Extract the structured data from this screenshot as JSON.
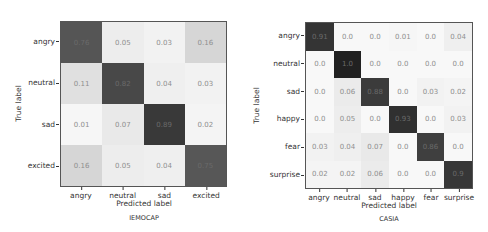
{
  "chart_data": [
    {
      "type": "heatmap",
      "title": "IEMOCAP",
      "xlabel": "Predicted label",
      "ylabel": "True label",
      "categories": [
        "angry",
        "neutral",
        "sad",
        "excited"
      ],
      "values": [
        [
          0.76,
          0.05,
          0.03,
          0.16
        ],
        [
          0.11,
          0.82,
          0.04,
          0.03
        ],
        [
          0.01,
          0.07,
          0.89,
          0.02
        ],
        [
          0.16,
          0.05,
          0.04,
          0.75
        ]
      ],
      "labels": [
        [
          "0.76",
          "0.05",
          "0.03",
          "0.16"
        ],
        [
          "0.11",
          "0.82",
          "0.04",
          "0.03"
        ],
        [
          "0.01",
          "0.07",
          "0.89",
          "0.02"
        ],
        [
          "0.16",
          "0.05",
          "0.04",
          "0.75"
        ]
      ],
      "colormap": "greys",
      "vrange": [
        0,
        1
      ]
    },
    {
      "type": "heatmap",
      "title": "CASIA",
      "xlabel": "Predicted label",
      "ylabel": "True label",
      "categories": [
        "angry",
        "neutral",
        "sad",
        "happy",
        "fear",
        "surprise"
      ],
      "values": [
        [
          0.91,
          0.0,
          0.0,
          0.01,
          0.0,
          0.04
        ],
        [
          0.0,
          1.0,
          0.0,
          0.0,
          0.0,
          0.0
        ],
        [
          0.0,
          0.06,
          0.88,
          0.0,
          0.03,
          0.02
        ],
        [
          0.0,
          0.05,
          0.0,
          0.93,
          0.0,
          0.03
        ],
        [
          0.03,
          0.04,
          0.07,
          0.0,
          0.86,
          0.0
        ],
        [
          0.02,
          0.02,
          0.06,
          0.0,
          0.0,
          0.9
        ]
      ],
      "labels": [
        [
          "0.91",
          "0.0",
          "0.0",
          "0.01",
          "0.0",
          "0.04"
        ],
        [
          "0.0",
          "1.0",
          "0.0",
          "0.0",
          "0.0",
          "0.0"
        ],
        [
          "0.0",
          "0.06",
          "0.88",
          "0.0",
          "0.03",
          "0.02"
        ],
        [
          "0.0",
          "0.05",
          "0.0",
          "0.93",
          "0.0",
          "0.03"
        ],
        [
          "0.03",
          "0.04",
          "0.07",
          "0.0",
          "0.86",
          "0.0"
        ],
        [
          "0.02",
          "0.02",
          "0.06",
          "0.0",
          "0.0",
          "0.9"
        ]
      ],
      "colormap": "greys",
      "vrange": [
        0,
        1
      ]
    }
  ]
}
